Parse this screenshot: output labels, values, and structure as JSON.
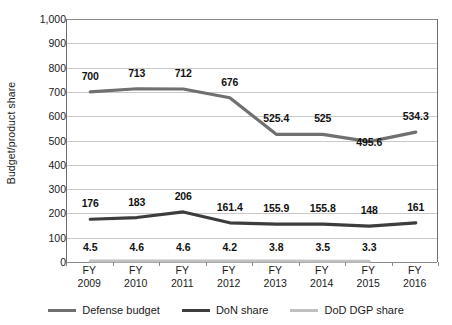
{
  "chart_data": {
    "type": "line",
    "title": "",
    "xlabel": "",
    "ylabel": "Budget/product share",
    "ylim": [
      0,
      1000
    ],
    "ytick_step": 100,
    "grid": true,
    "legend_position": "bottom",
    "categories": [
      "FY 2009",
      "FY 2010",
      "FY 2011",
      "FY 2012",
      "FY 2013",
      "FY 2014",
      "FY 2015",
      "FY 2016"
    ],
    "category_lines": [
      {
        "fy": "FY",
        "year": "2009"
      },
      {
        "fy": "FY",
        "year": "2010"
      },
      {
        "fy": "FY",
        "year": "2011"
      },
      {
        "fy": "FY",
        "year": "2012"
      },
      {
        "fy": "FY",
        "year": "2013"
      },
      {
        "fy": "FY",
        "year": "2014"
      },
      {
        "fy": "FY",
        "year": "2015"
      },
      {
        "fy": "FY",
        "year": "2016"
      }
    ],
    "ytick_labels": [
      "0",
      "100",
      "200",
      "300",
      "400",
      "500",
      "600",
      "700",
      "800",
      "900",
      "1,000"
    ],
    "ytick_values": [
      0,
      100,
      200,
      300,
      400,
      500,
      600,
      700,
      800,
      900,
      1000
    ],
    "series": [
      {
        "name": "Defense budget",
        "color": "#707070",
        "width": 3.2,
        "values": [
          700,
          713,
          712,
          676,
          525.4,
          525,
          495.6,
          534.3
        ],
        "labels": [
          "700",
          "713",
          "712",
          "676",
          "525.4",
          "525",
          "495.6",
          "534.3"
        ],
        "label_offsets": [
          10,
          10,
          10,
          10,
          10,
          10,
          -6,
          10
        ]
      },
      {
        "name": "DoN share",
        "color": "#3d3d3d",
        "width": 3.2,
        "values": [
          176,
          183,
          206,
          161.4,
          155.9,
          155.8,
          148,
          161
        ],
        "labels": [
          "176",
          "183",
          "206",
          "161.4",
          "155.9",
          "155.8",
          "148",
          "161"
        ],
        "label_offsets": [
          10,
          10,
          10,
          10,
          10,
          10,
          10,
          10
        ]
      },
      {
        "name": "DoD DGP share",
        "color": "#c0c0c0",
        "width": 3.0,
        "values": [
          4.5,
          4.6,
          4.6,
          4.2,
          3.8,
          3.5,
          3.3,
          null
        ],
        "labels": [
          "4.5",
          "4.6",
          "4.6",
          "4.2",
          "3.8",
          "3.5",
          "3.3",
          ""
        ],
        "label_offsets": [
          8,
          8,
          8,
          8,
          8,
          8,
          8,
          8
        ]
      }
    ]
  },
  "legend": {
    "items": [
      {
        "label": "Defense budget",
        "color": "#707070"
      },
      {
        "label": "DoN share",
        "color": "#3d3d3d"
      },
      {
        "label": "DoD DGP share",
        "color": "#c0c0c0"
      }
    ]
  }
}
